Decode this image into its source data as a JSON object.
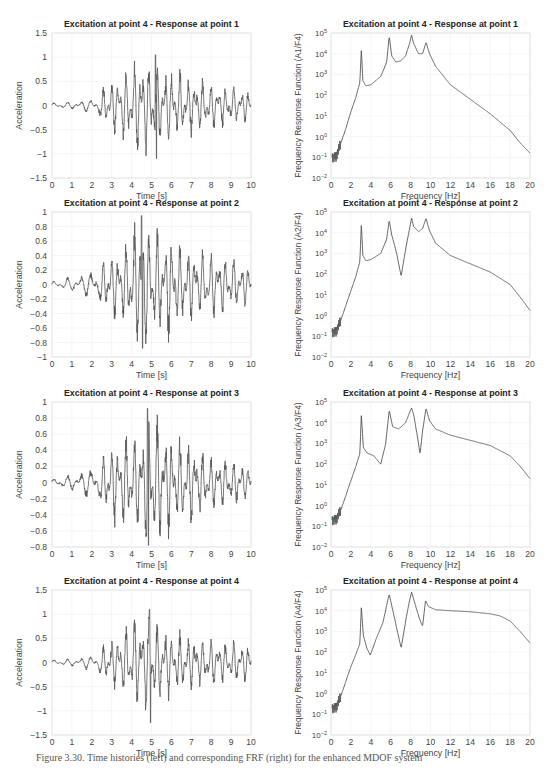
{
  "figure": {
    "caption": "Figure 3.30. Time histories (left) and corresponding FRF (right) for the enhanced MDOF system"
  },
  "chart_data": [
    {
      "type": "line",
      "title": "Excitation at point 4 - Response at point 1",
      "xlabel": "Time [s]",
      "ylabel": "Acceleration",
      "xlim": [
        0,
        10
      ],
      "ylim": [
        -1.5,
        1.5
      ],
      "xticks": [
        "0",
        "1",
        "2",
        "3",
        "4",
        "5",
        "6",
        "7",
        "8",
        "9",
        "10"
      ],
      "yticks": [
        "-1.5",
        "-1",
        "-0.5",
        "0",
        "0.5",
        "1",
        "1.5"
      ],
      "grid": true,
      "envelope": {
        "t": [
          0,
          1,
          2,
          2.5,
          3,
          3.5,
          4,
          4.3,
          4.6,
          5,
          5.3,
          5.7,
          6,
          6.5,
          7,
          7.5,
          8,
          8.5,
          9,
          9.5,
          10
        ],
        "amp": [
          0.06,
          0.08,
          0.15,
          0.3,
          0.55,
          0.7,
          0.85,
          1.0,
          0.9,
          1.05,
          0.9,
          0.8,
          0.75,
          0.7,
          0.6,
          0.55,
          0.5,
          0.45,
          0.4,
          0.35,
          0.3
        ]
      },
      "seed": 11,
      "peak": {
        "t": 5.2,
        "max": 1.05,
        "min": -1.1
      }
    },
    {
      "type": "line",
      "scale": "log",
      "title": "Excitation at point 4 - Response at point 1",
      "xlabel": "Frequency [Hz]",
      "ylabel": "Frequency Response Function (A1/F4)",
      "xlim": [
        0,
        20
      ],
      "ylim_log10": [
        -2,
        5
      ],
      "xticks": [
        "0",
        "2",
        "4",
        "6",
        "8",
        "10",
        "12",
        "14",
        "16",
        "18",
        "20"
      ],
      "yticks": [
        "10-2",
        "10-1",
        "100",
        "101",
        "102",
        "103",
        "104",
        "105"
      ],
      "grid": true,
      "x": [
        0.1,
        0.5,
        1,
        1.5,
        2,
        2.5,
        2.9,
        3.05,
        3.2,
        3.5,
        4,
        5,
        5.6,
        5.85,
        6.1,
        6.5,
        7,
        7.5,
        7.9,
        8.1,
        8.3,
        8.8,
        9.2,
        9.55,
        9.9,
        10.5,
        12,
        14,
        16,
        18,
        19,
        20
      ],
      "log_y": [
        -1,
        -1,
        -0.3,
        0.4,
        1.2,
        1.9,
        2.6,
        4.2,
        2.7,
        2.45,
        2.5,
        2.9,
        3.6,
        4.85,
        3.9,
        3.6,
        3.65,
        3.9,
        4.5,
        4.9,
        4.5,
        4.0,
        4.0,
        4.55,
        4.0,
        3.4,
        2.5,
        1.8,
        1.1,
        0.3,
        -0.3,
        -0.8
      ]
    },
    {
      "type": "line",
      "title": "Excitation at point 4 - Response at point 2",
      "xlabel": "Time [s]",
      "ylabel": "Acceleration",
      "xlim": [
        0,
        10
      ],
      "ylim": [
        -1,
        1
      ],
      "xticks": [
        "0",
        "1",
        "2",
        "3",
        "4",
        "5",
        "6",
        "7",
        "8",
        "9",
        "10"
      ],
      "yticks": [
        "-1",
        "-0.8",
        "-0.6",
        "-0.4",
        "-0.2",
        "0",
        "0.2",
        "0.4",
        "0.6",
        "0.8",
        "1"
      ],
      "grid": true,
      "envelope": {
        "t": [
          0,
          1,
          2,
          2.5,
          3,
          3.5,
          4,
          4.5,
          5,
          5.5,
          6,
          6.5,
          7,
          7.5,
          8,
          8.5,
          9,
          9.5,
          10
        ],
        "amp": [
          0.05,
          0.1,
          0.2,
          0.3,
          0.45,
          0.45,
          0.75,
          0.95,
          0.85,
          0.75,
          0.7,
          0.55,
          0.5,
          0.45,
          0.45,
          0.4,
          0.35,
          0.3,
          0.25
        ]
      },
      "seed": 23,
      "peak": {
        "t": 4.5,
        "max": 0.95,
        "min": -0.88
      }
    },
    {
      "type": "line",
      "scale": "log",
      "title": "Excitation at point 4 - Response at point 2",
      "xlabel": "Frequency [Hz]",
      "ylabel": "Frequency Response Function (A2/F4)",
      "xlim": [
        0,
        20
      ],
      "ylim_log10": [
        -2,
        5
      ],
      "xticks": [
        "0",
        "2",
        "4",
        "6",
        "8",
        "10",
        "12",
        "14",
        "16",
        "18",
        "20"
      ],
      "yticks": [
        "10-2",
        "10-1",
        "100",
        "101",
        "102",
        "103",
        "104",
        "105"
      ],
      "grid": true,
      "x": [
        0.1,
        0.5,
        1,
        1.5,
        2,
        2.5,
        2.9,
        3.05,
        3.2,
        3.5,
        4,
        5,
        5.6,
        5.85,
        6.1,
        6.6,
        7.05,
        7.5,
        7.9,
        8.1,
        8.3,
        8.8,
        9.2,
        9.55,
        9.9,
        10.5,
        12,
        14,
        16,
        18,
        19,
        20
      ],
      "log_y": [
        -0.8,
        -0.8,
        -0.2,
        0.5,
        1.2,
        1.9,
        2.6,
        4.4,
        2.9,
        2.65,
        2.7,
        3.0,
        3.7,
        4.6,
        3.9,
        3.0,
        1.9,
        3.2,
        4.2,
        4.7,
        4.3,
        4.05,
        4.2,
        4.7,
        4.1,
        3.5,
        2.9,
        2.5,
        2.1,
        1.5,
        0.9,
        0.25
      ]
    },
    {
      "type": "line",
      "title": "Excitation at point 4 - Response at point 3",
      "xlabel": "Time [s]",
      "ylabel": "Acceleration",
      "xlim": [
        0,
        10
      ],
      "ylim": [
        -0.8,
        1
      ],
      "xticks": [
        "0",
        "1",
        "2",
        "3",
        "4",
        "5",
        "6",
        "7",
        "8",
        "9",
        "10"
      ],
      "yticks": [
        "-0.8",
        "-0.6",
        "-0.4",
        "-0.2",
        "0",
        "0.2",
        "0.4",
        "0.6",
        "0.8",
        "1"
      ],
      "grid": true,
      "envelope": {
        "t": [
          0,
          1,
          2,
          2.5,
          3,
          3.5,
          4,
          4.5,
          4.8,
          5.2,
          5.6,
          6,
          6.5,
          7,
          7.5,
          8,
          8.5,
          9,
          9.5,
          10
        ],
        "amp": [
          0.05,
          0.1,
          0.2,
          0.3,
          0.5,
          0.55,
          0.6,
          0.7,
          0.9,
          0.8,
          0.7,
          0.6,
          0.55,
          0.5,
          0.4,
          0.35,
          0.3,
          0.3,
          0.25,
          0.2
        ]
      },
      "seed": 37,
      "peak": {
        "t": 4.8,
        "max": 0.92,
        "min": -0.78
      }
    },
    {
      "type": "line",
      "scale": "log",
      "title": "Excitation at point 4 - Response at point 3",
      "xlabel": "Frequency [Hz]",
      "ylabel": "Frequency Response Function (A3/F4)",
      "xlim": [
        0,
        20
      ],
      "ylim_log10": [
        -2,
        5
      ],
      "xticks": [
        "0",
        "2",
        "4",
        "6",
        "8",
        "10",
        "12",
        "14",
        "16",
        "18",
        "20"
      ],
      "yticks": [
        "10-2",
        "10-1",
        "100",
        "101",
        "102",
        "103",
        "104",
        "105"
      ],
      "grid": true,
      "x": [
        0.1,
        0.5,
        1,
        1.5,
        2,
        2.5,
        2.9,
        3.05,
        3.25,
        3.6,
        4.3,
        5.0,
        5.5,
        5.85,
        6.2,
        6.8,
        7.5,
        7.9,
        8.1,
        8.3,
        8.7,
        8.95,
        9.2,
        9.55,
        9.9,
        10.5,
        12,
        14,
        16,
        18,
        19,
        20
      ],
      "log_y": [
        -0.7,
        -0.7,
        -0.2,
        0.5,
        1.2,
        1.9,
        2.5,
        4.4,
        2.8,
        2.55,
        2.4,
        2.0,
        3.0,
        4.6,
        3.8,
        3.7,
        4.0,
        4.5,
        4.7,
        4.4,
        3.3,
        2.5,
        3.6,
        4.7,
        4.1,
        3.7,
        3.4,
        3.15,
        2.9,
        2.4,
        1.9,
        1.3
      ]
    },
    {
      "type": "line",
      "title": "Excitation at point 4 - Response at point 4",
      "xlabel": "Time [s]",
      "ylabel": "Acceleration",
      "xlim": [
        0,
        10
      ],
      "ylim": [
        -1.5,
        1.5
      ],
      "xticks": [
        "0",
        "1",
        "2",
        "3",
        "4",
        "5",
        "6",
        "7",
        "8",
        "9",
        "10"
      ],
      "yticks": [
        "-1.5",
        "-1",
        "-0.5",
        "0",
        "0.5",
        "1",
        "1.5"
      ],
      "grid": true,
      "envelope": {
        "t": [
          0,
          1,
          2,
          2.5,
          3,
          3.5,
          4,
          4.5,
          4.8,
          5,
          5.3,
          5.7,
          6,
          6.5,
          7,
          7.5,
          8,
          8.5,
          9,
          9.5,
          10
        ],
        "amp": [
          0.06,
          0.08,
          0.15,
          0.3,
          0.5,
          0.6,
          0.9,
          1.0,
          1.05,
          0.95,
          0.85,
          0.75,
          0.7,
          0.6,
          0.55,
          0.5,
          0.5,
          0.45,
          0.45,
          0.4,
          0.4
        ]
      },
      "seed": 51,
      "peak": {
        "t": 4.9,
        "max": 1.1,
        "min": -1.25
      }
    },
    {
      "type": "line",
      "scale": "log",
      "title": "Excitation at point 4 - Response at point 4",
      "xlabel": "Frequency [Hz]",
      "ylabel": "Frequency Response Function (A4/F4)",
      "xlim": [
        0,
        20
      ],
      "ylim_log10": [
        -2,
        5
      ],
      "xticks": [
        "0",
        "2",
        "4",
        "6",
        "8",
        "10",
        "12",
        "14",
        "16",
        "18",
        "20"
      ],
      "yticks": [
        "10-2",
        "10-1",
        "100",
        "101",
        "102",
        "103",
        "104",
        "105"
      ],
      "grid": true,
      "x": [
        0.1,
        0.5,
        1,
        1.5,
        2,
        2.5,
        2.9,
        3.05,
        3.25,
        3.6,
        3.95,
        4.5,
        5.2,
        5.85,
        6.4,
        7.05,
        7.5,
        7.9,
        8.1,
        8.4,
        8.9,
        9.2,
        9.5,
        9.8,
        10.5,
        12,
        14,
        16,
        17,
        18,
        19,
        20
      ],
      "log_y": [
        -0.7,
        -0.7,
        -0.1,
        0.6,
        1.3,
        1.9,
        2.4,
        4.2,
        2.8,
        2.2,
        1.85,
        2.6,
        3.4,
        4.8,
        3.6,
        2.2,
        3.5,
        4.5,
        4.9,
        4.4,
        3.6,
        3.25,
        4.5,
        4.2,
        4.05,
        4.0,
        3.95,
        3.85,
        3.75,
        3.5,
        3.0,
        2.45
      ]
    }
  ]
}
